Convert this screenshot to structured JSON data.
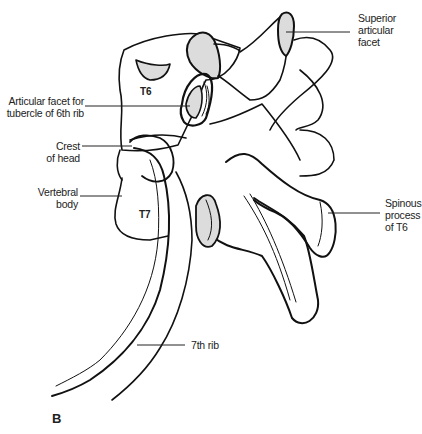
{
  "figure": {
    "panel_label": "B",
    "vertebra_labels": [
      "T6",
      "T7"
    ],
    "colors": {
      "line": "#111111",
      "facet_fill": "#dcdcdc",
      "leader": "#222222"
    }
  },
  "labels": {
    "superior_articular_facet": [
      "Superior",
      "articular",
      "facet"
    ],
    "articular_facet_tubercle": [
      "Articular facet for",
      "tubercle of 6th rib"
    ],
    "crest_of_head": [
      "Crest",
      "of head"
    ],
    "vertebral_body": [
      "Vertebral",
      "body"
    ],
    "spinous_process": [
      "Spinous",
      "process",
      "of T6"
    ],
    "seventh_rib": [
      "7th rib"
    ]
  }
}
